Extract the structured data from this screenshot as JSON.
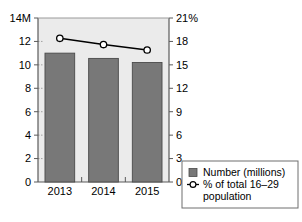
{
  "chart_data": {
    "type": "bar",
    "title": "",
    "subtitle": "",
    "xlabel": "",
    "categories": [
      "2013",
      "2014",
      "2015"
    ],
    "grid": false,
    "legend_position": "bottom-right",
    "axes": {
      "left": {
        "ylabel": "",
        "unit_suffix": "M",
        "ylim": [
          0,
          14
        ],
        "tick_values": [
          0,
          2,
          4,
          6,
          8,
          10,
          12,
          14
        ],
        "tick_labels": [
          "0",
          "2",
          "4",
          "6",
          "8",
          "10",
          "12",
          "14M"
        ]
      },
      "right": {
        "ylabel": "",
        "unit_suffix": "%",
        "ylim": [
          0,
          21
        ],
        "tick_values": [
          0,
          3,
          6,
          9,
          12,
          15,
          18,
          21
        ],
        "tick_labels": [
          "0",
          "3",
          "6",
          "9",
          "12",
          "15",
          "18",
          "21%"
        ]
      }
    },
    "series": [
      {
        "name": "Number (millions)",
        "type": "bar",
        "axis": "left",
        "color": "#787878",
        "values": [
          11.0,
          10.55,
          10.2
        ]
      },
      {
        "name": "% of total 16–29 population",
        "type": "line",
        "axis": "right",
        "color": "#000000",
        "marker": "open-circle",
        "values": [
          18.4,
          17.6,
          16.9
        ]
      }
    ]
  },
  "legend": {
    "items": [
      {
        "label": "Number (millions)",
        "swatch": "bar-swatch-icon",
        "color": "#787878"
      },
      {
        "label": "% of total 16–29",
        "label_line2": "population",
        "swatch": "line-marker-icon",
        "color": "#000000"
      }
    ]
  },
  "colors": {
    "bar_fill": "#787878",
    "bar_edge": "#4a4a4a",
    "plot_background": "#ebebeb",
    "line": "#000000",
    "marker_fill": "#ffffff",
    "axis": "#5a5a5a",
    "legend_border": "#6e6e6e",
    "page_background": "#ffffff"
  }
}
